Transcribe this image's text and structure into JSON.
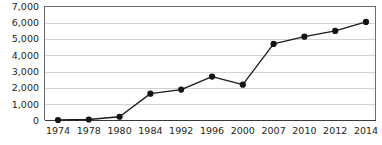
{
  "chart_data": {
    "type": "line",
    "title": "",
    "subtitle": "",
    "xlabel": "",
    "ylabel": "",
    "categories": [
      "1974",
      "1978",
      "1980",
      "1984",
      "1992",
      "1996",
      "2000",
      "2007",
      "2010",
      "2012",
      "2014"
    ],
    "values": [
      30,
      60,
      230,
      1650,
      1900,
      2700,
      2200,
      4700,
      5150,
      5500,
      6050
    ],
    "series": [
      {
        "name": "series-1",
        "values": [
          30,
          60,
          230,
          1650,
          1900,
          2700,
          2200,
          4700,
          5150,
          5500,
          6050
        ],
        "color": "#141414",
        "marker": "circle"
      }
    ],
    "ylim": [
      0,
      7000
    ],
    "ytick_labels": [
      "0",
      "1,000",
      "2,000",
      "3,000",
      "4,000",
      "5,000",
      "6,000",
      "7,000"
    ],
    "ytick_values": [
      0,
      1000,
      2000,
      3000,
      4000,
      5000,
      6000,
      7000
    ],
    "xtick_labels": [
      "1974",
      "1978",
      "1980",
      "1984",
      "1992",
      "1996",
      "2000",
      "2007",
      "2010",
      "2012",
      "2014"
    ],
    "grid": true,
    "grid_axis": "y",
    "grid_color": "#c8c8c8",
    "legend": false,
    "legend_position": "none",
    "annotations": [],
    "background_color": "#ffffff",
    "axis_color": "#6d6d6d",
    "text_color": "#231f20"
  }
}
